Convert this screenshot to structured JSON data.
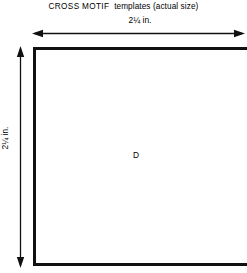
{
  "figure": {
    "caption": {
      "motif_name": "CROSS MOTIF",
      "rest": "templates (actual size)",
      "full": "CROSS MOTIF  templates (actual size)"
    },
    "background_color": "#ffffff",
    "line_color": "#111111"
  },
  "dimensions": {
    "width": {
      "value": "2¼ in.",
      "number": "2¼",
      "unit": "in.",
      "orientation": "horizontal",
      "arrow_style": "double-headed"
    },
    "height": {
      "value": "2¼ in.",
      "number": "2¼",
      "unit": "in.",
      "orientation": "vertical",
      "arrow_style": "double-headed"
    }
  },
  "template": {
    "id": "D",
    "shape": "rectangle",
    "label": "D"
  }
}
